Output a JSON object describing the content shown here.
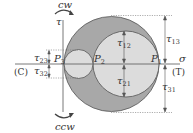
{
  "diagram": {
    "type": "mohr-circle",
    "axes": {
      "tau_label": "τ",
      "sigma_label": "σ",
      "compression_label": "(C)",
      "tension_label": "(T)"
    },
    "rotation": {
      "top": "cw",
      "bottom": "ccw"
    },
    "points": {
      "p1": {
        "base": "P",
        "sub": "1"
      },
      "p2": {
        "base": "P",
        "sub": "2"
      },
      "p3": {
        "base": "P",
        "sub": "3"
      }
    },
    "shear_labels": {
      "t12": {
        "base": "τ",
        "sub": "12"
      },
      "t21": {
        "base": "τ",
        "sub": "21"
      },
      "t13": {
        "base": "τ",
        "sub": "13"
      },
      "t31": {
        "base": "τ",
        "sub": "31"
      },
      "t23": {
        "base": "τ",
        "sub": "23"
      },
      "t32": {
        "base": "τ",
        "sub": "32"
      }
    },
    "colors": {
      "outer_fill": "#a8a8a8",
      "inner_fill": "#dcdcdc",
      "stroke": "#555555",
      "background": "#ffffff"
    }
  }
}
